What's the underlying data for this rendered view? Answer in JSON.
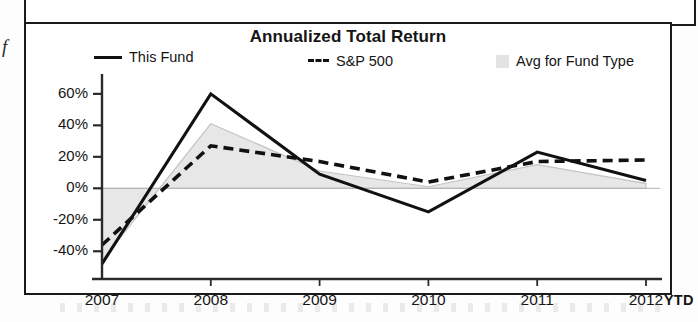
{
  "chart_data": {
    "type": "line",
    "title": "Annualized Total Return",
    "xlabel": "",
    "ylabel": "",
    "categories": [
      "2007",
      "2008",
      "2009",
      "2010",
      "2011",
      "2012"
    ],
    "x_axis_suffix": "YTD",
    "ylim": [
      -50,
      65
    ],
    "ytick_labels": [
      "60%",
      "40%",
      "20%",
      "0%",
      "-20%",
      "-40%"
    ],
    "ytick_values": [
      60,
      40,
      20,
      0,
      -20,
      -40
    ],
    "grid": false,
    "zero_line": true,
    "legend_position": "top",
    "series": [
      {
        "name": "This Fund",
        "style": "solid-line",
        "color": "#111111",
        "values": [
          -48,
          60,
          9,
          -15,
          23,
          5
        ]
      },
      {
        "name": "S&P 500",
        "style": "dashed-line",
        "color": "#111111",
        "values": [
          -36,
          27,
          17,
          4,
          17,
          18
        ]
      },
      {
        "name": "Avg for Fund Type",
        "style": "shaded-area",
        "color": "#d9d9d9",
        "values": [
          -46,
          41,
          11,
          1,
          15,
          3
        ]
      }
    ]
  },
  "legend": {
    "fund_label": "This Fund",
    "sp500_label": "S&P 500",
    "avg_label": "Avg for Fund Type"
  },
  "page": {
    "margin_glyph": "f"
  }
}
